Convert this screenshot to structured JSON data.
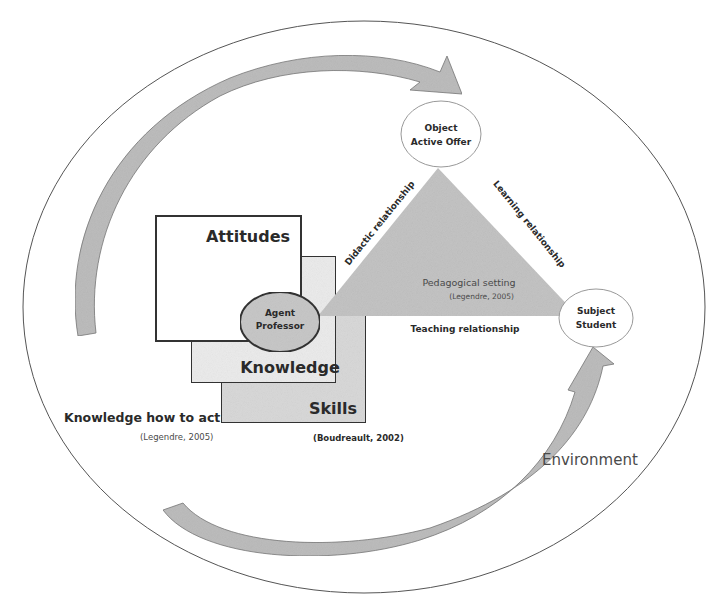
{
  "diagram": {
    "environment": {
      "label": "Environment"
    },
    "agent": {
      "line1": "Agent",
      "line2": "Professor"
    },
    "object": {
      "line1": "Object",
      "line2": "Active Offer"
    },
    "subject": {
      "line1": "Subject",
      "line2": "Student"
    },
    "boxes": {
      "attitudes": "Attitudes",
      "knowledge": "Knowledge",
      "skills": "Skills"
    },
    "knowledge_how_to_act": {
      "label": "Knowledge how to act",
      "citation": "(Legendre, 2005)"
    },
    "boxes_citation": "(Boudreault, 2002)",
    "triangle": {
      "center_label": "Pedagogical setting",
      "center_citation": "(Legendre, 2005)",
      "left_edge": "Didactic relationship",
      "right_edge": "Learning relationship",
      "bottom_edge": "Teaching relationship"
    },
    "colors": {
      "arrow_fill": "#bdbdbd",
      "triangle_fill": "#c4c4c4",
      "skills_fill": "#d9d9d9",
      "knowledge_fill": "#ececec",
      "attitudes_fill": "#ffffff",
      "agent_fill": "#c8c8c8",
      "outline": "#333333"
    }
  }
}
